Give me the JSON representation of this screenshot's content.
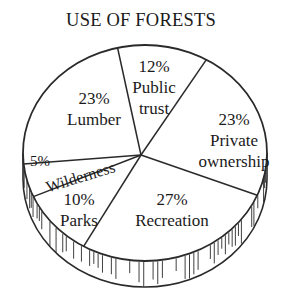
{
  "chart_data": {
    "type": "pie",
    "title": "USE OF FORESTS",
    "categories": [
      "Public trust",
      "Private ownership",
      "Recreation",
      "Parks",
      "Wilderness",
      "Lumber"
    ],
    "values": [
      12,
      23,
      27,
      10,
      5,
      23
    ],
    "unit": "%",
    "labels": [
      {
        "pct": "12%",
        "lines": [
          "Public",
          "trust"
        ]
      },
      {
        "pct": "23%",
        "lines": [
          "Private",
          "ownership"
        ]
      },
      {
        "pct": "27%",
        "lines": [
          "Recreation"
        ]
      },
      {
        "pct": "10%",
        "lines": [
          "Parks"
        ]
      },
      {
        "pct": "5%",
        "lines": [
          "Wilderness"
        ]
      },
      {
        "pct": "23%",
        "lines": [
          "Lumber"
        ]
      }
    ],
    "style": "3D disc, black-and-white line art with hatched rim",
    "legend": "none (labels inside slices)"
  },
  "colors": {
    "ink": "#2a2a2a",
    "background": "#ffffff"
  }
}
